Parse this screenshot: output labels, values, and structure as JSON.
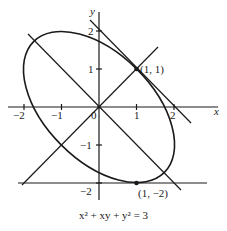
{
  "figure": {
    "caption": "x² + xy + y² = 3",
    "x_axis_label": "x",
    "y_axis_label": "y",
    "x_ticks": [
      {
        "value": -2,
        "label": "−2"
      },
      {
        "value": -1,
        "label": "−1"
      },
      {
        "value": 1,
        "label": "1"
      },
      {
        "value": 2,
        "label": "2"
      }
    ],
    "y_ticks": [
      {
        "value": 2,
        "label": "2"
      },
      {
        "value": 1,
        "label": "1"
      },
      {
        "value": -1,
        "label": "−1"
      },
      {
        "value": -2,
        "label": "−2"
      }
    ],
    "origin_label": "0",
    "points": [
      {
        "label": "(1, 1)",
        "x": 1,
        "y": 1
      },
      {
        "label": "(1, −2)",
        "x": 1,
        "y": -2
      }
    ],
    "curve": "ellipse x² + xy + y² = 3",
    "lines": [
      "tangent at (1,1): x + y = 2",
      "tangent at (1,−2): y = −2",
      "line y = x",
      "line y = −x"
    ],
    "stroke_color": "#1a1a1a",
    "background_color": "#ffffff"
  }
}
